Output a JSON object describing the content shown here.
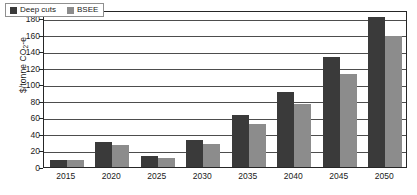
{
  "chart_data": {
    "type": "bar",
    "title": "",
    "subtitle": "",
    "xlabel": "",
    "ylabel": "$/tonne CO2-e",
    "ylabel_rich": {
      "prefix": "$/tonne CO",
      "subscript": "2",
      "suffix": "-e"
    },
    "categories": [
      "2015",
      "2020",
      "2025",
      "2030",
      "2035",
      "2040",
      "2045",
      "2050"
    ],
    "series": [
      {
        "name": "Deep cuts",
        "color": "#3a3a3a",
        "values": [
          9,
          30,
          13,
          33,
          63,
          91,
          133,
          181
        ]
      },
      {
        "name": "BSEE",
        "color": "#8c8c8c",
        "values": [
          8.5,
          27,
          10.5,
          27.5,
          52,
          76,
          112,
          158
        ]
      }
    ],
    "ylim": [
      0,
      190
    ],
    "yticks": [
      0,
      20,
      40,
      60,
      80,
      100,
      120,
      140,
      160,
      180
    ],
    "ytick_labels": [
      "0",
      "20",
      "40",
      "60",
      "80",
      "100",
      "120",
      "140",
      "160",
      "180"
    ],
    "grid": true,
    "grid_axis": "y",
    "legend": {
      "position": "top-left-inside",
      "entries": [
        {
          "label": "Deep cuts",
          "color": "#3a3a3a"
        },
        {
          "label": "BSEE",
          "color": "#8c8c8c"
        }
      ]
    },
    "bar_width_px": 17,
    "group_gap_px": 0,
    "background": "#ffffff",
    "frame_color": "#262626",
    "grid_color": "#4d4d4d"
  }
}
